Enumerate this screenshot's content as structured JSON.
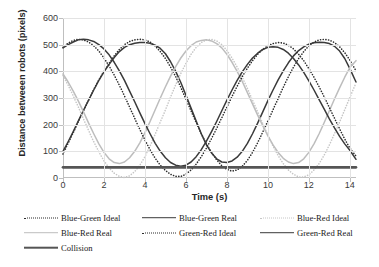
{
  "chart_data": {
    "type": "line",
    "title": "",
    "xlabel": "Time (s)",
    "ylabel": "Distance betweeen robots (pixels)",
    "xlim": [
      0,
      14.3
    ],
    "ylim": [
      0,
      600
    ],
    "xticks": [
      0,
      2,
      4,
      6,
      8,
      10,
      12,
      14
    ],
    "yticks": [
      0,
      100,
      200,
      300,
      400,
      500,
      600
    ],
    "grid": true,
    "legend_position": "bottom",
    "collision_threshold": 40,
    "series": [
      {
        "name": "Blue-Green Ideal",
        "style": "dotted",
        "color": "#2b2b2b",
        "x": [
          0,
          0.25,
          0.5,
          0.75,
          1,
          1.25,
          1.5,
          1.75,
          2,
          2.25,
          2.5,
          2.75,
          3,
          3.25,
          3.5,
          3.75,
          4,
          4.25,
          4.5,
          4.75,
          5,
          5.25,
          5.5,
          5.75,
          6,
          6.25,
          6.5,
          6.75,
          7,
          7.25,
          7.5,
          7.75,
          8,
          8.25,
          8.5,
          8.75,
          9,
          9.25,
          9.5,
          9.75,
          10,
          10.25,
          10.5,
          10.75,
          11,
          11.25,
          11.5,
          11.75,
          12,
          12.25,
          12.5,
          12.75,
          13,
          13.25,
          13.5,
          13.75,
          14,
          14.3
        ],
        "y": [
          90,
          130,
          170,
          212,
          252,
          292,
          332,
          368,
          400,
          430,
          458,
          482,
          500,
          512,
          518,
          520,
          518,
          510,
          495,
          474,
          448,
          416,
          380,
          340,
          296,
          252,
          208,
          166,
          128,
          96,
          68,
          46,
          32,
          26,
          30,
          44,
          66,
          96,
          132,
          172,
          214,
          256,
          298,
          340,
          380,
          416,
          448,
          474,
          496,
          510,
          518,
          520,
          517,
          508,
          492,
          470,
          442,
          402
        ]
      },
      {
        "name": "Blue-Green Real",
        "style": "solid",
        "color": "#3a3a3a",
        "x": [
          0,
          0.25,
          0.5,
          0.75,
          1,
          1.25,
          1.5,
          1.75,
          2,
          2.25,
          2.5,
          2.75,
          3,
          3.25,
          3.5,
          3.75,
          4,
          4.25,
          4.5,
          4.75,
          5,
          5.25,
          5.5,
          5.75,
          6,
          6.25,
          6.5,
          6.75,
          7,
          7.25,
          7.5,
          7.75,
          8,
          8.25,
          8.5,
          8.75,
          9,
          9.25,
          9.5,
          9.75,
          10,
          10.25,
          10.5,
          10.75,
          11,
          11.25,
          11.5,
          11.75,
          12,
          12.25,
          12.5,
          12.75,
          13,
          13.25,
          13.5,
          13.75,
          14,
          14.3
        ],
        "y": [
          100,
          136,
          174,
          214,
          254,
          292,
          330,
          366,
          398,
          426,
          452,
          474,
          490,
          500,
          505,
          508,
          508,
          505,
          498,
          486,
          466,
          436,
          400,
          358,
          310,
          262,
          214,
          166,
          124,
          94,
          72,
          60,
          58,
          64,
          78,
          100,
          130,
          166,
          206,
          248,
          290,
          330,
          368,
          402,
          432,
          458,
          478,
          492,
          502,
          507,
          509,
          508,
          504,
          494,
          476,
          448,
          410,
          360
        ]
      },
      {
        "name": "Blue-Red Ideal",
        "style": "dotted",
        "color": "#c6c6c6",
        "x": [
          0,
          0.25,
          0.5,
          0.75,
          1,
          1.25,
          1.5,
          1.75,
          2,
          2.25,
          2.5,
          2.75,
          3,
          3.25,
          3.5,
          3.75,
          4,
          4.25,
          4.5,
          4.75,
          5,
          5.25,
          5.5,
          5.75,
          6,
          6.25,
          6.5,
          6.75,
          7,
          7.25,
          7.5,
          7.75,
          8,
          8.25,
          8.5,
          8.75,
          9,
          9.25,
          9.5,
          9.75,
          10,
          10.25,
          10.5,
          10.75,
          11,
          11.25,
          11.5,
          11.75,
          12,
          12.25,
          12.5,
          12.75,
          13,
          13.25,
          13.5,
          13.75,
          14,
          14.3
        ],
        "y": [
          384,
          348,
          308,
          266,
          222,
          178,
          136,
          98,
          64,
          38,
          18,
          6,
          2,
          8,
          24,
          48,
          80,
          120,
          164,
          210,
          256,
          304,
          350,
          392,
          430,
          464,
          490,
          508,
          518,
          520,
          514,
          500,
          478,
          450,
          416,
          378,
          336,
          292,
          248,
          204,
          160,
          120,
          84,
          54,
          30,
          14,
          4,
          4,
          12,
          30,
          54,
          86,
          124,
          166,
          210,
          256,
          302,
          356
        ]
      },
      {
        "name": "Blue-Red Real",
        "style": "solid",
        "color": "#bdbdbd",
        "x": [
          0,
          0.25,
          0.5,
          0.75,
          1,
          1.25,
          1.5,
          1.75,
          2,
          2.25,
          2.5,
          2.75,
          3,
          3.25,
          3.5,
          3.75,
          4,
          4.25,
          4.5,
          4.75,
          5,
          5.25,
          5.5,
          5.75,
          6,
          6.25,
          6.5,
          6.75,
          7,
          7.25,
          7.5,
          7.75,
          8,
          8.25,
          8.5,
          8.75,
          9,
          9.25,
          9.5,
          9.75,
          10,
          10.25,
          10.5,
          10.75,
          11,
          11.25,
          11.5,
          11.75,
          12,
          12.25,
          12.5,
          12.75,
          13,
          13.25,
          13.5,
          13.75,
          14,
          14.3
        ],
        "y": [
          390,
          360,
          326,
          288,
          248,
          206,
          166,
          128,
          96,
          72,
          58,
          54,
          60,
          76,
          100,
          132,
          170,
          212,
          256,
          300,
          342,
          382,
          418,
          450,
          476,
          496,
          510,
          516,
          518,
          514,
          504,
          488,
          464,
          434,
          400,
          362,
          320,
          278,
          236,
          196,
          158,
          124,
          96,
          74,
          60,
          54,
          58,
          72,
          96,
          128,
          166,
          208,
          252,
          296,
          338,
          378,
          414,
          440
        ]
      },
      {
        "name": "Green-Red Ideal",
        "style": "dotted",
        "color": "#2b2b2b",
        "x": [
          0,
          0.25,
          0.5,
          0.75,
          1,
          1.25,
          1.5,
          1.75,
          2,
          2.25,
          2.5,
          2.75,
          3,
          3.25,
          3.5,
          3.75,
          4,
          4.25,
          4.5,
          4.75,
          5,
          5.25,
          5.5,
          5.75,
          6,
          6.25,
          6.5,
          6.75,
          7,
          7.25,
          7.5,
          7.75,
          8,
          8.25,
          8.5,
          8.75,
          9,
          9.25,
          9.5,
          9.75,
          10,
          10.25,
          10.5,
          10.75,
          11,
          11.25,
          11.5,
          11.75,
          12,
          12.25,
          12.5,
          12.75,
          13,
          13.25,
          13.5,
          13.75,
          14,
          14.3
        ],
        "y": [
          490,
          506,
          516,
          520,
          518,
          510,
          496,
          476,
          450,
          420,
          386,
          348,
          308,
          266,
          224,
          182,
          142,
          106,
          74,
          48,
          28,
          14,
          6,
          6,
          14,
          30,
          52,
          80,
          112,
          148,
          186,
          226,
          266,
          306,
          344,
          380,
          412,
          440,
          464,
          482,
          496,
          504,
          508,
          506,
          498,
          484,
          464,
          440,
          410,
          378,
          342,
          304,
          264,
          224,
          184,
          146,
          112,
          82
        ]
      },
      {
        "name": "Green-Red Real",
        "style": "solid",
        "color": "#3a3a3a",
        "x": [
          0,
          0.25,
          0.5,
          0.75,
          1,
          1.25,
          1.5,
          1.75,
          2,
          2.25,
          2.5,
          2.75,
          3,
          3.25,
          3.5,
          3.75,
          4,
          4.25,
          4.5,
          4.75,
          5,
          5.25,
          5.5,
          5.75,
          6,
          6.25,
          6.5,
          6.75,
          7,
          7.25,
          7.5,
          7.75,
          8,
          8.25,
          8.5,
          8.75,
          9,
          9.25,
          9.5,
          9.75,
          10,
          10.25,
          10.5,
          10.75,
          11,
          11.25,
          11.5,
          11.75,
          12,
          12.25,
          12.5,
          12.75,
          13,
          13.25,
          13.5,
          13.75,
          14,
          14.3
        ],
        "y": [
          488,
          500,
          510,
          518,
          520,
          518,
          512,
          500,
          484,
          462,
          434,
          402,
          366,
          326,
          286,
          244,
          204,
          166,
          130,
          100,
          76,
          58,
          48,
          44,
          48,
          60,
          80,
          106,
          138,
          174,
          212,
          252,
          292,
          330,
          366,
          398,
          426,
          450,
          468,
          482,
          490,
          492,
          490,
          482,
          468,
          448,
          424,
          396,
          364,
          330,
          294,
          258,
          222,
          188,
          156,
          128,
          104,
          70
        ]
      },
      {
        "name": "Collision",
        "style": "solid-thick",
        "color": "#555555",
        "x": [
          0,
          14.3
        ],
        "y": [
          40,
          40
        ]
      }
    ]
  },
  "axes": {
    "ylabel": "Distance betweeen robots (pixels)",
    "xlabel": "Time (s)",
    "yticks": [
      "600",
      "500",
      "400",
      "300",
      "200",
      "100",
      "0"
    ],
    "xticks": [
      "0",
      "2",
      "4",
      "6",
      "8",
      "10",
      "12",
      "14"
    ]
  },
  "legend": {
    "rows": [
      [
        {
          "label": "Blue-Green Ideal",
          "style": "dotted",
          "color": "#2b2b2b"
        },
        {
          "label": "Blue-Green Real",
          "style": "solid",
          "color": "#3a3a3a"
        },
        {
          "label": "Blue-Red Ideal",
          "style": "dotted",
          "color": "#c6c6c6"
        }
      ],
      [
        {
          "label": "Blue-Red Real",
          "style": "solid",
          "color": "#bdbdbd"
        },
        {
          "label": "Green-Red Ideal",
          "style": "dotted",
          "color": "#2b2b2b"
        },
        {
          "label": "Green-Red Real",
          "style": "solid",
          "color": "#3a3a3a"
        }
      ],
      [
        {
          "label": "Collision",
          "style": "solid-thick",
          "color": "#555555"
        }
      ]
    ]
  }
}
